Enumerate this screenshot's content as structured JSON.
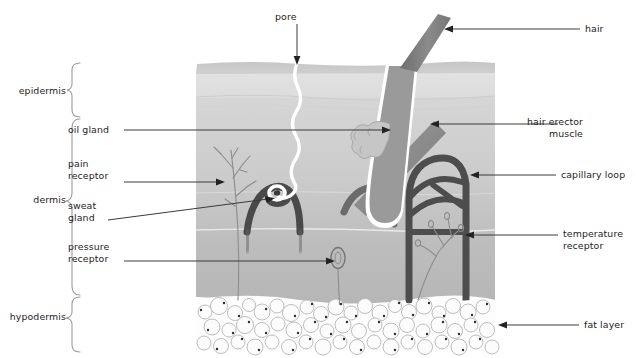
{
  "diagram": {
    "layers": [
      {
        "id": "epidermis",
        "label": "epidermis",
        "bracket": {
          "x": 72,
          "top": 63,
          "bottom": 117
        },
        "label_x": 5,
        "label_y": 86
      },
      {
        "id": "dermis",
        "label": "dermis",
        "bracket": {
          "x": 72,
          "top": 119,
          "bottom": 295
        },
        "label_x": 22,
        "label_y": 201
      },
      {
        "id": "hypodermis",
        "label": "hypodermis",
        "bracket": {
          "x": 72,
          "top": 297,
          "bottom": 352
        },
        "label_x": 3,
        "label_y": 318
      }
    ],
    "callouts": [
      {
        "id": "pore",
        "label": "pore",
        "side": "top",
        "text_x": 274,
        "text_y": 10,
        "leader": "M297,24 L297,62",
        "arrow": "down",
        "arrow_x": 297,
        "arrow_y": 63
      },
      {
        "id": "hair",
        "label": "hair",
        "side": "right",
        "text_x": 585,
        "text_y": 24,
        "leader": "M580,29 L446,29",
        "arrow": "left",
        "arrow_x": 445,
        "arrow_y": 29
      },
      {
        "id": "hair-erector-muscle",
        "label": "hair erector\nmuscle",
        "side": "right",
        "text_x": 563,
        "text_y": 117,
        "leader": "M558,124 L432,124",
        "arrow": "left",
        "arrow_x": 431,
        "arrow_y": 124
      },
      {
        "id": "capillary-loop",
        "label": "capillary loop",
        "side": "right",
        "text_x": 561,
        "text_y": 169,
        "leader": "M556,175 L472,175",
        "arrow": "left",
        "arrow_x": 471,
        "arrow_y": 175
      },
      {
        "id": "temperature-receptor",
        "label": "temperature\nreceptor",
        "side": "right",
        "text_x": 563,
        "text_y": 229,
        "leader": "M558,235 L467,235",
        "arrow": "left",
        "arrow_x": 466,
        "arrow_y": 235
      },
      {
        "id": "fat-layer",
        "label": "fat layer",
        "side": "right",
        "text_x": 584,
        "text_y": 320,
        "leader": "M579,325 L500,325",
        "arrow": "left",
        "arrow_x": 499,
        "arrow_y": 325
      },
      {
        "id": "oil-gland",
        "label": "oil gland",
        "side": "left",
        "text_x": 68,
        "text_y": 124,
        "leader": "M122,130 L388,130",
        "arrow": "right",
        "arrow_x": 389,
        "arrow_y": 130
      },
      {
        "id": "pain-receptor",
        "label": "pain\nreceptor",
        "side": "left",
        "text_x": 68,
        "text_y": 158,
        "leader": "M122,182 L222,182",
        "arrow": "right",
        "arrow_x": 223,
        "arrow_y": 182
      },
      {
        "id": "sweat-gland",
        "label": "sweat\ngland",
        "side": "left",
        "text_x": 68,
        "text_y": 200,
        "leader": "M108,219 L270,198",
        "arrow": "right",
        "arrow_x": 272,
        "arrow_y": 197
      },
      {
        "id": "pressure-receptor",
        "label": "pressure\nreceptor",
        "side": "left",
        "text_x": 68,
        "text_y": 241,
        "leader": "M122,261 L332,261",
        "arrow": "right",
        "arrow_x": 333,
        "arrow_y": 261
      }
    ],
    "colors": {
      "background": "#ffffff",
      "text": "#1d1d1d",
      "leader_line": "#3a3a3a",
      "epidermis_top": "#c9c9c9",
      "epidermis_body": "#dcdcdc",
      "dermis_upper": "#cfcfcf",
      "dermis_lower": "#b9b9b9",
      "fat_cell_fill": "#fbfbfb",
      "fat_cell_stroke": "#b4b4b4",
      "vessel_dark": "#4a4a4a",
      "hair_shaft": "#808080",
      "hair_sheath": "#ffffff",
      "muscle": "#8a8a8a",
      "nerve": "#8f8f8f",
      "bracket": "#9a9a9a"
    },
    "structures": [
      {
        "id": "skin-block",
        "name": "skin-block",
        "x": 195,
        "y": 62,
        "width": 300,
        "height": 236
      },
      {
        "id": "epidermis-band",
        "name": "epidermis-band",
        "note": "darker grey strip at top surface"
      },
      {
        "id": "pore-duct",
        "name": "pore-duct",
        "note": "wavy white sweat duct from surface to sweat gland"
      },
      {
        "id": "hair-shaft",
        "name": "hair-shaft",
        "note": "grey shaft emerging at angle from follicle"
      },
      {
        "id": "hair-follicle",
        "name": "hair-follicle",
        "note": "white-outlined bulb surrounding hair root"
      },
      {
        "id": "oil-gland-lobes",
        "name": "oil-gland-lobes",
        "note": "small lobed gland attached to follicle"
      },
      {
        "id": "erector-muscle",
        "name": "erector-muscle",
        "note": "grey diagonal band to follicle"
      },
      {
        "id": "capillary-loop",
        "name": "capillary-loop",
        "note": "dark looping blood vessel, right side"
      },
      {
        "id": "sweat-gland-coil",
        "name": "sweat-gland-coil",
        "note": "dark arch with coiled top, left-centre"
      },
      {
        "id": "pain-receptor-nerve",
        "name": "pain-receptor-nerve",
        "note": "fine branching free nerve endings"
      },
      {
        "id": "pressure-receptor-corpuscle",
        "name": "pressure-receptor-corpuscle",
        "note": "small oval encapsulated corpuscle"
      },
      {
        "id": "temperature-receptor-nerve",
        "name": "temperature-receptor-nerve",
        "note": "branched nerve endings, right-lower dermis"
      },
      {
        "id": "fat-layer-cells",
        "name": "fat-layer-cells",
        "note": "cluster of round adipocytes at base"
      }
    ]
  }
}
